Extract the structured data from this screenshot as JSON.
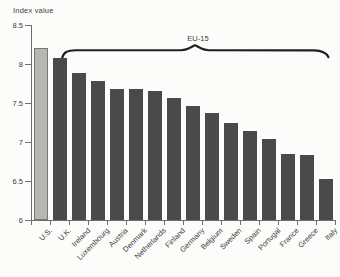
{
  "figure": {
    "axis_title": "Index value",
    "group_label": "EU-15"
  },
  "chart_data": {
    "type": "bar",
    "title": "",
    "ylabel": "Index value",
    "xlabel": "",
    "categories": [
      "U.S.",
      "U.K.",
      "Ireland",
      "Luxembourg",
      "Austria",
      "Denmark",
      "Netherlands",
      "Finland",
      "Germany",
      "Belgium",
      "Sweden",
      "Spain",
      "Portugal",
      "France",
      "Greece",
      "Italy"
    ],
    "values": [
      8.2,
      8.08,
      7.88,
      7.78,
      7.68,
      7.68,
      7.66,
      7.56,
      7.46,
      7.37,
      7.25,
      7.14,
      7.04,
      6.84,
      6.83,
      6.52
    ],
    "ylim": [
      6,
      8.5
    ],
    "yticks": [
      8.5,
      8,
      7.5,
      7,
      6.5,
      6
    ],
    "grid": false,
    "legend": "none",
    "annotations": [
      {
        "type": "brace",
        "text": "EU-15",
        "span_categories": [
          "U.K.",
          "Italy"
        ]
      }
    ],
    "highlight": {
      "category": "U.S.",
      "color": "#b6b6b2"
    },
    "bar_color": "#4a4a4a"
  },
  "colors": {
    "background": "#fcfcfa",
    "axis": "#6e6e6e",
    "text": "#3d3d3d",
    "brace": "#1f1f1f",
    "us_bar": "#b6b6b2",
    "us_bar_border": "#767672",
    "eu_bar": "#4a4a4a"
  }
}
